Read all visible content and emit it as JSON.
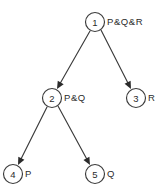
{
  "diagram": {
    "background_color": "#ffffff",
    "stroke_color": "#3b3b3b",
    "text_color": "#2b2b2b",
    "nodes": [
      {
        "id": "1",
        "number": "1",
        "label": "P&Q&R",
        "cx": 95,
        "cy": 22,
        "r": 9.5,
        "label_x": 107,
        "label_y": 21
      },
      {
        "id": "2",
        "number": "2",
        "label": "P&Q",
        "cx": 52,
        "cy": 98,
        "r": 9.5,
        "label_x": 64,
        "label_y": 97
      },
      {
        "id": "3",
        "number": "3",
        "label": "R",
        "cx": 136,
        "cy": 98,
        "r": 9.5,
        "label_x": 148,
        "label_y": 97
      },
      {
        "id": "4",
        "number": "4",
        "label": "P",
        "cx": 13,
        "cy": 174,
        "r": 9.5,
        "label_x": 25,
        "label_y": 173
      },
      {
        "id": "5",
        "number": "5",
        "label": "Q",
        "cx": 95,
        "cy": 174,
        "r": 9.5,
        "label_x": 107,
        "label_y": 173
      }
    ],
    "edges": [
      {
        "id": "e1",
        "from": "1",
        "to": "2",
        "x1": 90,
        "y1": 31,
        "x2": 57,
        "y2": 89
      },
      {
        "id": "e2",
        "from": "1",
        "to": "3",
        "x1": 101,
        "y1": 30,
        "x2": 131,
        "y2": 89
      },
      {
        "id": "e3",
        "from": "2",
        "to": "4",
        "x1": 47,
        "y1": 107,
        "x2": 18,
        "y2": 165
      },
      {
        "id": "e4",
        "from": "2",
        "to": "5",
        "x1": 58,
        "y1": 106,
        "x2": 90,
        "y2": 165
      }
    ]
  }
}
